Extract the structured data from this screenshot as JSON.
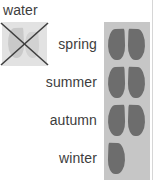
{
  "legend": {
    "title": "water",
    "disabled_swatch": {
      "icon": "crossed-out-water-drop",
      "meaning": "no water"
    },
    "rows": [
      {
        "label": "spring",
        "drops": 2
      },
      {
        "label": "summer",
        "drops": 2
      },
      {
        "label": "autumn",
        "drops": 2
      },
      {
        "label": "winter",
        "drops": 1
      }
    ],
    "colors": {
      "drop": "#6d6d6d",
      "swatch_background": "#c6c6c6",
      "faded_swatch_background": "#e2e2e2",
      "cross_stroke": "#3f3f3f",
      "text": "#3d3d3d",
      "rule": "#d6d6d6",
      "page_background": "#ffffff"
    }
  }
}
